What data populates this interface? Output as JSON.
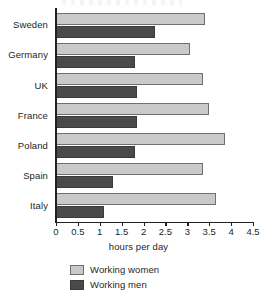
{
  "chart_data": {
    "type": "bar",
    "orientation": "horizontal",
    "title": "",
    "xlabel": "hours per day",
    "ylabel": "",
    "xlim": [
      0,
      4.5
    ],
    "xticks": [
      "0",
      "0.5",
      "1",
      "1.5",
      "2",
      "2.5",
      "3",
      "3.5",
      "4",
      "4.5"
    ],
    "xtick_values": [
      0,
      0.5,
      1,
      1.5,
      2,
      2.5,
      3,
      3.5,
      4,
      4.5
    ],
    "grid": false,
    "legend_position": "bottom",
    "categories": [
      "Sweden",
      "Germany",
      "UK",
      "France",
      "Poland",
      "Spain",
      "Italy"
    ],
    "series": [
      {
        "name": "Working women",
        "color": "#c9c9c9",
        "values": [
          3.4,
          3.05,
          3.35,
          3.5,
          3.85,
          3.35,
          3.65
        ]
      },
      {
        "name": "Working men",
        "color": "#4a4a4a",
        "values": [
          2.25,
          1.8,
          1.85,
          1.85,
          1.8,
          1.3,
          1.1
        ]
      }
    ]
  },
  "axis": {
    "x_title": "hours per day"
  },
  "legend": {
    "items": [
      {
        "label": "Working women",
        "color": "#c9c9c9"
      },
      {
        "label": "Working men",
        "color": "#4a4a4a"
      }
    ]
  }
}
